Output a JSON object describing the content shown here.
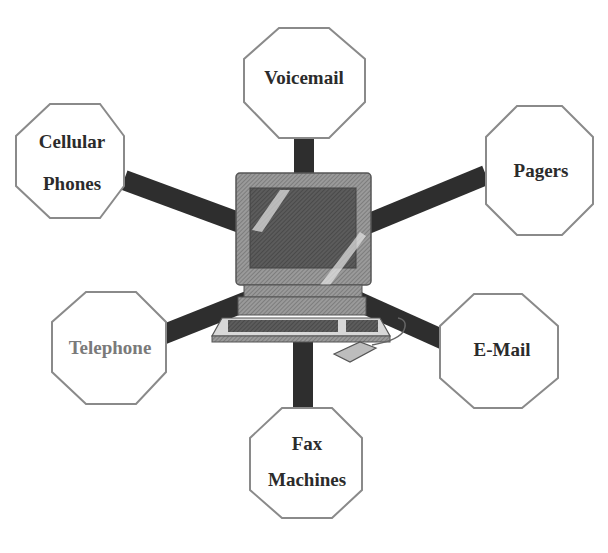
{
  "diagram": {
    "title": "",
    "center": {
      "label": "Computer",
      "icon": "computer-workstation-icon"
    },
    "colors": {
      "background": "#ffffff",
      "connector": "#2e2e2e",
      "octagon_fill": "#ffffff",
      "octagon_stroke": "#8a8a8a",
      "text": "#2b2b2b",
      "text_muted": "#7a7a7a",
      "monitor": "#8c8c8c",
      "screen": "#5e5e5e"
    },
    "nodes": [
      {
        "id": "voicemail",
        "lines": [
          "Voicemail"
        ],
        "cx": 304,
        "cy": 73
      },
      {
        "id": "cellular-phones",
        "lines": [
          "Cellular",
          "Phones"
        ],
        "cx": 75,
        "cy": 161
      },
      {
        "id": "pagers",
        "lines": [
          "Pagers"
        ],
        "cx": 539,
        "cy": 171
      },
      {
        "id": "telephone",
        "lines": [
          "Telephone"
        ],
        "cx": 111,
        "cy": 348
      },
      {
        "id": "e-mail",
        "lines": [
          "E-Mail"
        ],
        "cx": 498,
        "cy": 350
      },
      {
        "id": "fax-machines",
        "lines": [
          "Fax",
          "Machines"
        ],
        "cx": 307,
        "cy": 464
      }
    ]
  }
}
